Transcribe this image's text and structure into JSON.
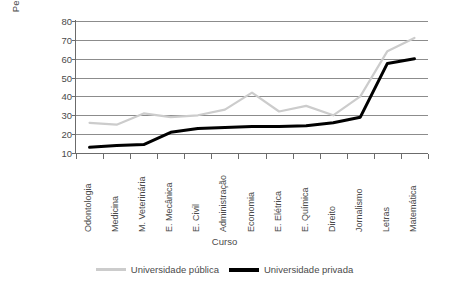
{
  "chart_data": {
    "type": "line",
    "title": "",
    "xlabel": "Curso",
    "ylabel": "Percentagem",
    "ylim": [
      10,
      80
    ],
    "yticks": [
      10,
      20,
      30,
      40,
      50,
      60,
      70,
      80
    ],
    "grid": true,
    "legend_position": "bottom",
    "categories": [
      "Odontologia",
      "Medicina",
      "M. Veterinária",
      "E. Mecânica",
      "E. Civil",
      "Administração",
      "Economia",
      "E. Elétrica",
      "E. Química",
      "Direito",
      "Jornalismo",
      "Letras",
      "Matemática"
    ],
    "series": [
      {
        "name": "Universidade pública",
        "color": "#cccccc",
        "values": [
          26,
          25,
          31,
          29,
          30,
          33,
          42,
          32,
          35,
          30,
          40,
          64,
          71
        ]
      },
      {
        "name": "Universidade privada",
        "color": "#000000",
        "values": [
          13,
          14,
          14.5,
          21,
          23,
          23.5,
          24,
          24,
          24.5,
          26,
          29,
          57.5,
          60
        ]
      }
    ]
  },
  "axes": {
    "y_title": "Percentagem",
    "x_title": "Curso"
  },
  "legend": {
    "items": [
      {
        "label": "Universidade pública"
      },
      {
        "label": "Universidade privada"
      }
    ]
  },
  "colors": {
    "public_line": "#cccccc",
    "private_line": "#000000",
    "grid": "#8c8c8c",
    "axis": "#6b6b6b",
    "text": "#4a4a4a",
    "background": "#ffffff"
  }
}
